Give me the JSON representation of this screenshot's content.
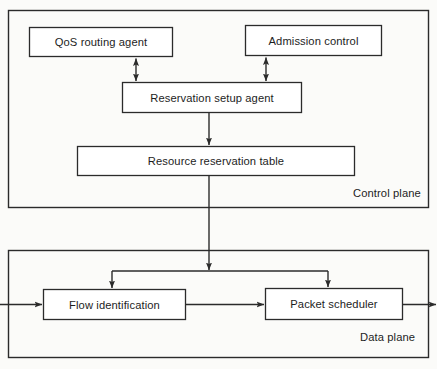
{
  "diagram": {
    "background_color": "#fbfbf9",
    "line_color": "#2b2b2b",
    "text_color": "#1d1d1d"
  },
  "planes": [
    {
      "id": "control-plane",
      "label": "Control plane",
      "label_x": 353,
      "label_y": 187,
      "x": 8,
      "y": 10,
      "width": 421,
      "height": 198
    },
    {
      "id": "data-plane",
      "label": "Data plane",
      "label_x": 360,
      "label_y": 331,
      "x": 8,
      "y": 250,
      "width": 421,
      "height": 108
    }
  ],
  "nodes": [
    {
      "id": "qos-routing-agent",
      "label": "QoS routing agent",
      "x": 29,
      "y": 27,
      "width": 144,
      "height": 30
    },
    {
      "id": "admission-control",
      "label": "Admission control",
      "x": 245,
      "y": 25,
      "width": 137,
      "height": 31
    },
    {
      "id": "reservation-setup-agent",
      "label": "Reservation setup agent",
      "x": 122,
      "y": 82,
      "width": 180,
      "height": 31
    },
    {
      "id": "resource-reservation-table",
      "label": "Resource reservation table",
      "x": 77,
      "y": 146,
      "width": 278,
      "height": 30
    },
    {
      "id": "flow-identification",
      "label": "Flow identification",
      "x": 43,
      "y": 289,
      "width": 143,
      "height": 31
    },
    {
      "id": "packet-scheduler",
      "label": "Packet scheduler",
      "x": 265,
      "y": 288,
      "width": 138,
      "height": 32
    }
  ],
  "connectors": [
    {
      "id": "qos-to-setup",
      "from": "qos-routing-agent",
      "to": "reservation-setup-agent",
      "style": "bidirectional-vertical"
    },
    {
      "id": "admission-to-setup",
      "from": "admission-control",
      "to": "reservation-setup-agent",
      "style": "bidirectional-vertical"
    },
    {
      "id": "setup-to-table",
      "from": "reservation-setup-agent",
      "to": "resource-reservation-table",
      "style": "arrow-down"
    },
    {
      "id": "table-to-data-plane-bus",
      "from": "resource-reservation-table",
      "to": "distribution-bus",
      "style": "arrow-down-crossing-planes"
    },
    {
      "id": "bus-to-flow-identification",
      "from": "distribution-bus",
      "to": "flow-identification",
      "style": "elbow-arrow-down"
    },
    {
      "id": "bus-to-packet-scheduler",
      "from": "distribution-bus",
      "to": "packet-scheduler",
      "style": "elbow-arrow-down"
    },
    {
      "id": "ingress-to-flow-identification",
      "from": "ingress",
      "to": "flow-identification",
      "style": "arrow-right"
    },
    {
      "id": "flow-identification-to-packet-scheduler",
      "from": "flow-identification",
      "to": "packet-scheduler",
      "style": "arrow-right"
    },
    {
      "id": "packet-scheduler-to-egress",
      "from": "packet-scheduler",
      "to": "egress",
      "style": "arrow-right"
    }
  ]
}
